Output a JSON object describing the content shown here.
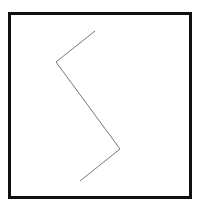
{
  "diagram": {
    "frame": {
      "x": 9.5,
      "y": 13.5,
      "width": 181,
      "height": 184,
      "stroke": "#111111",
      "stroke_width": 3
    },
    "polyline": {
      "points": [
        [
          95,
          31
        ],
        [
          56,
          62
        ],
        [
          120,
          149
        ],
        [
          80,
          181
        ]
      ],
      "stroke": "#777777",
      "stroke_width": 1
    }
  }
}
